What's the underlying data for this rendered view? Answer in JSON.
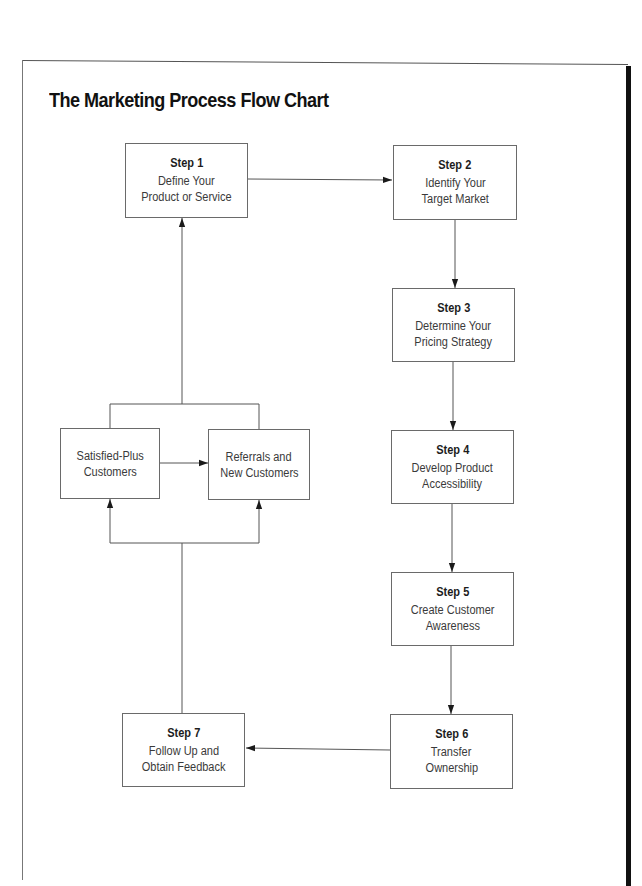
{
  "title": "The Marketing Process Flow Chart",
  "steps": [
    {
      "label": "Step 1",
      "line1": "Define Your",
      "line2": "Product or Service"
    },
    {
      "label": "Step 2",
      "line1": "Identify Your",
      "line2": "Target Market"
    },
    {
      "label": "Step 3",
      "line1": "Determine Your",
      "line2": "Pricing Strategy"
    },
    {
      "label": "Step 4",
      "line1": "Develop Product",
      "line2": "Accessibility"
    },
    {
      "label": "Step 5",
      "line1": "Create Customer",
      "line2": "Awareness"
    },
    {
      "label": "Step 6",
      "line1": "Transfer",
      "line2": "Ownership"
    },
    {
      "label": "Step 7",
      "line1": "Follow Up and",
      "line2": "Obtain Feedback"
    }
  ],
  "feedback_loop": {
    "satisfied": {
      "line1": "Satisfied-Plus",
      "line2": "Customers"
    },
    "referrals": {
      "line1": "Referrals and",
      "line2": "New Customers"
    }
  },
  "flow": [
    "Step 1 -> Step 2",
    "Step 2 -> Step 3",
    "Step 3 -> Step 4",
    "Step 4 -> Step 5",
    "Step 5 -> Step 6",
    "Step 6 -> Step 7",
    "Step 7 -> Satisfied-Plus Customers & Referrals and New Customers",
    "Satisfied-Plus Customers -> Referrals and New Customers",
    "Satisfied-Plus Customers & Referrals and New Customers -> Step 1"
  ],
  "colors": {
    "line": "#555555",
    "box_border": "#6a6a6a",
    "frame_accent": "#111111"
  }
}
